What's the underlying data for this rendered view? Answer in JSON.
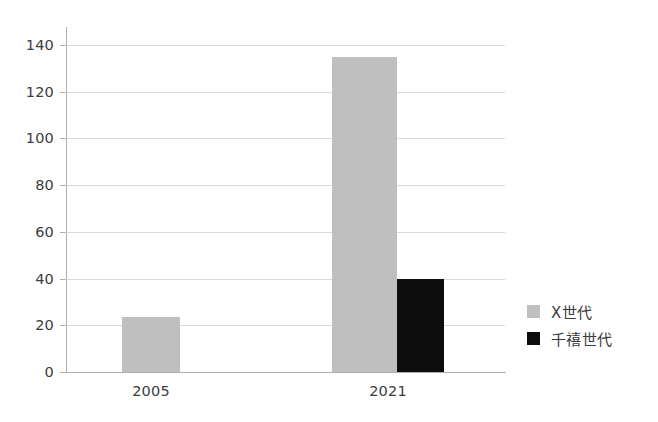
{
  "chart_data": {
    "type": "bar",
    "title": "",
    "subtitle": "",
    "xlabel": "",
    "ylabel": "",
    "categories": [
      "2005",
      "2021"
    ],
    "series": [
      {
        "name": "X世代",
        "color": "#bfbfbf",
        "values": [
          23.5,
          135
        ]
      },
      {
        "name": "千禧世代",
        "color": "#0d0d0d",
        "values": [
          null,
          40
        ]
      }
    ],
    "ylim": [
      0,
      140
    ],
    "ytick_labels": [
      "0",
      "20",
      "40",
      "60",
      "80",
      "100",
      "120",
      "140"
    ],
    "ytick_values": [
      0,
      20,
      40,
      60,
      80,
      100,
      120,
      140
    ],
    "grid": true,
    "grid_axis": "y",
    "legend": {
      "position": "right",
      "entries": [
        {
          "label": "X世代",
          "color": "#bfbfbf"
        },
        {
          "label": "千禧世代",
          "color": "#0d0d0d"
        }
      ]
    },
    "background_color": "#ffffff",
    "axis_color": "#adadad",
    "grid_color": "#d9d9d9",
    "text_color": "#3c3c3c"
  }
}
